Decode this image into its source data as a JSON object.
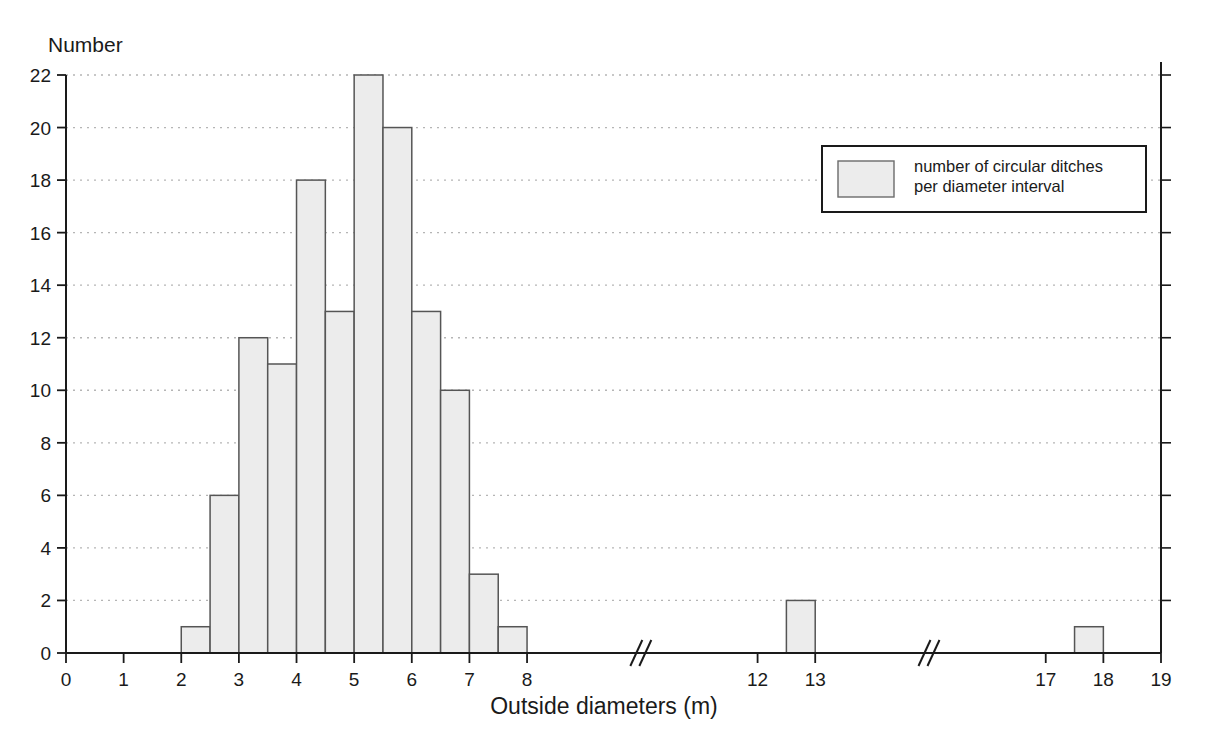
{
  "chart_data": {
    "type": "bar",
    "title": "",
    "subtitle": "",
    "ylabel": "Number",
    "xlabel": "Outside diameters (m)",
    "ylim": [
      0,
      22
    ],
    "xlim": [
      0,
      19
    ],
    "grid": true,
    "bin_width": 0.5,
    "y_ticks": [
      0,
      2,
      4,
      6,
      8,
      10,
      12,
      14,
      16,
      18,
      20,
      22
    ],
    "x_ticks": [
      0,
      1,
      2,
      3,
      4,
      5,
      6,
      7,
      8,
      12,
      13,
      17,
      18,
      19
    ],
    "axis_breaks": [
      {
        "label": "//",
        "between": [
          8,
          12
        ]
      },
      {
        "label": "//",
        "between": [
          13,
          17
        ]
      }
    ],
    "legend": {
      "position": "top-right",
      "entries": [
        {
          "label_line1": "number of circular ditches",
          "label_line2": "per diameter interval",
          "swatch_fill": "#ececec",
          "swatch_stroke": "#6b6b6b"
        }
      ]
    },
    "colors": {
      "bar_fill": "#ececec",
      "bar_stroke": "#555555",
      "axis": "#1a1a1a",
      "grid": "#b5b5b5",
      "background": "#ffffff"
    },
    "bins": [
      {
        "x0": 0.0,
        "x1": 0.5,
        "value": 0
      },
      {
        "x0": 0.5,
        "x1": 1.0,
        "value": 0
      },
      {
        "x0": 1.0,
        "x1": 1.5,
        "value": 0
      },
      {
        "x0": 1.5,
        "x1": 2.0,
        "value": 0
      },
      {
        "x0": 2.0,
        "x1": 2.5,
        "value": 1
      },
      {
        "x0": 2.5,
        "x1": 3.0,
        "value": 6
      },
      {
        "x0": 3.0,
        "x1": 3.5,
        "value": 12
      },
      {
        "x0": 3.5,
        "x1": 4.0,
        "value": 11
      },
      {
        "x0": 4.0,
        "x1": 4.5,
        "value": 18
      },
      {
        "x0": 4.5,
        "x1": 5.0,
        "value": 13
      },
      {
        "x0": 5.0,
        "x1": 5.5,
        "value": 22
      },
      {
        "x0": 5.5,
        "x1": 6.0,
        "value": 20
      },
      {
        "x0": 6.0,
        "x1": 6.5,
        "value": 13
      },
      {
        "x0": 6.5,
        "x1": 7.0,
        "value": 10
      },
      {
        "x0": 7.0,
        "x1": 7.5,
        "value": 3
      },
      {
        "x0": 7.5,
        "x1": 8.0,
        "value": 1
      },
      {
        "x0": 12.5,
        "x1": 13.0,
        "value": 2
      },
      {
        "x0": 17.5,
        "x1": 18.0,
        "value": 1
      }
    ],
    "categories": [
      "2.0-2.5",
      "2.5-3.0",
      "3.0-3.5",
      "3.5-4.0",
      "4.0-4.5",
      "4.5-5.0",
      "5.0-5.5",
      "5.5-6.0",
      "6.0-6.5",
      "6.5-7.0",
      "7.0-7.5",
      "7.5-8.0",
      "12.5-13.0",
      "17.5-18.0"
    ],
    "values": [
      1,
      6,
      12,
      11,
      18,
      13,
      22,
      20,
      13,
      10,
      3,
      1,
      2,
      1
    ],
    "total_count": 133
  }
}
